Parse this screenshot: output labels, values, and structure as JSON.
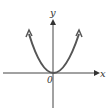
{
  "diagram": {
    "type": "function-graph",
    "curve": "parabola opening upward with vertex at origin",
    "axes": {
      "x_label": "x",
      "y_label": "y",
      "origin_label": "0"
    },
    "colors": {
      "axis": "#333333",
      "curve": "#555555"
    }
  }
}
